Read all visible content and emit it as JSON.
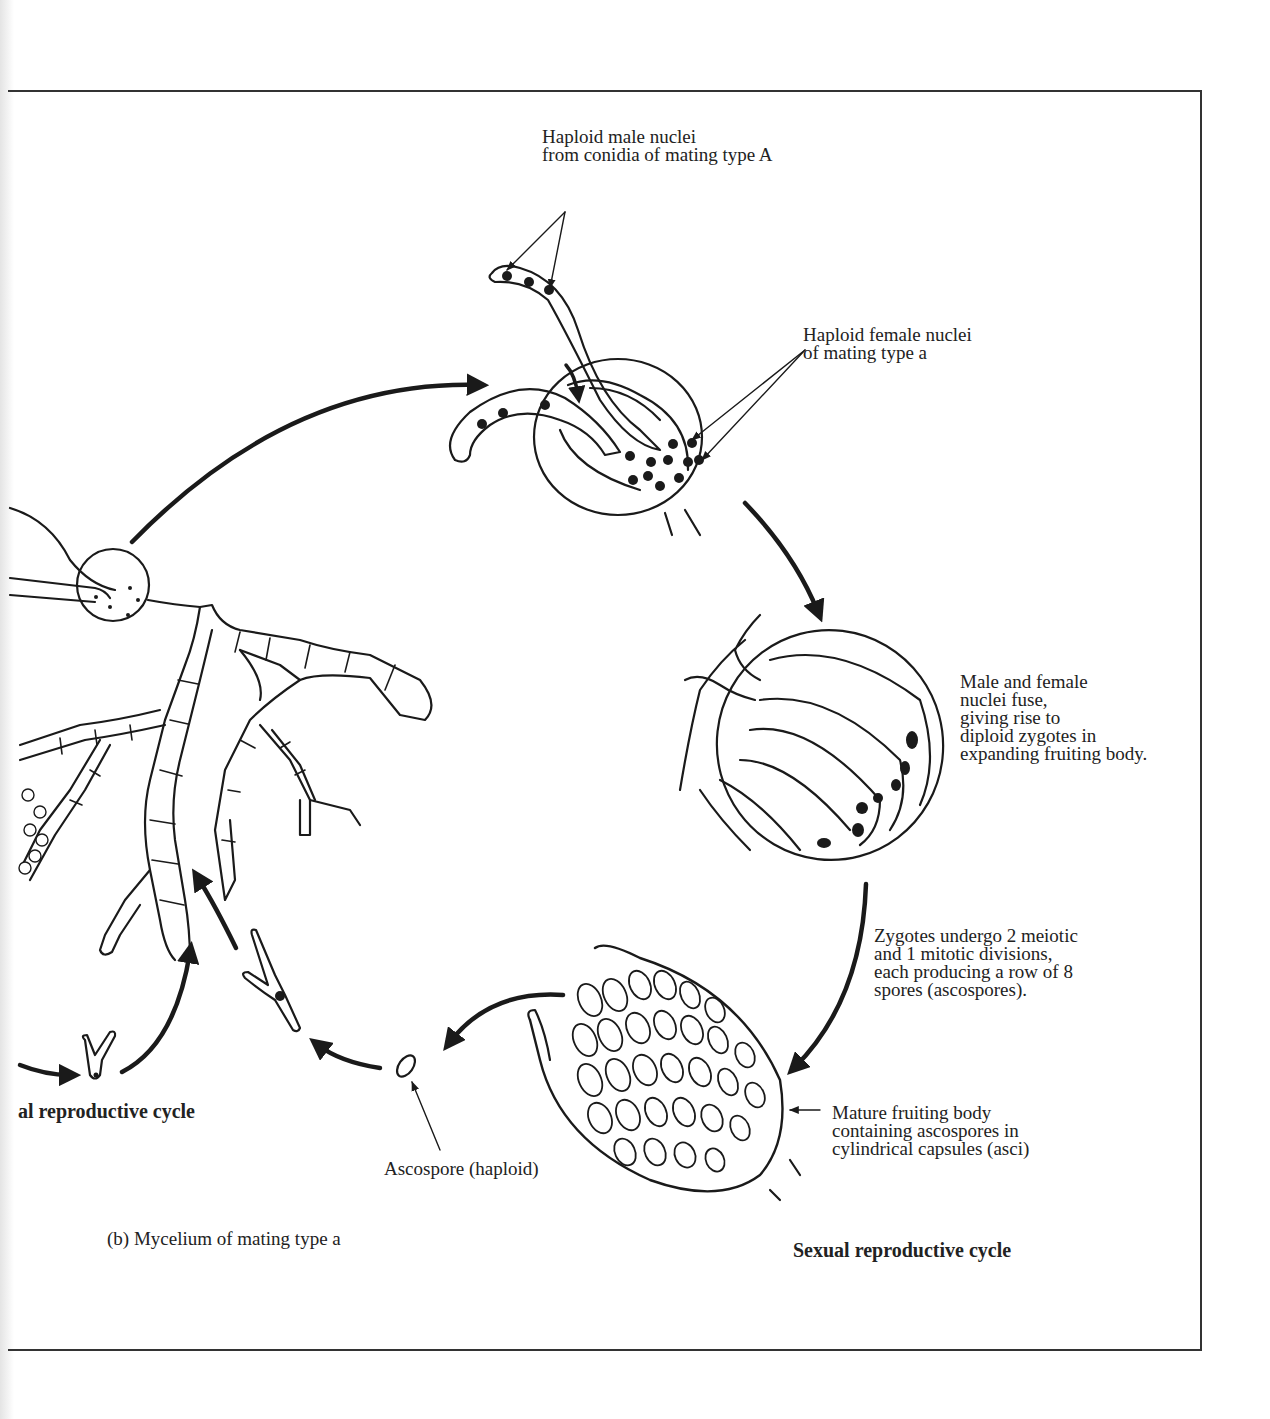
{
  "figure": {
    "panel_label": "(b) Mycelium of mating type a",
    "cycles": {
      "asexual_partial": "al reproductive cycle",
      "sexual": "Sexual reproductive cycle"
    },
    "annotations": {
      "male_nuclei": "Haploid male nuclei\nfrom conidia of mating type  A",
      "female_nuclei": "Haploid female nuclei\nof mating type  a",
      "fusion": "Male and female\nnuclei fuse,\ngiving rise to\ndiploid zygotes in\nexpanding fruiting body.",
      "meiosis": "Zygotes undergo 2 meiotic\nand 1 mitotic divisions,\neach producing a row of 8\nspores (ascospores).",
      "mature_body": "Mature fruiting body\ncontaining ascospores in\ncylindrical capsules (asci)",
      "ascospore": "Ascospore (haploid)"
    },
    "colors": {
      "ink": "#1a1a1a",
      "paper": "#ffffff",
      "frame": "#333333"
    }
  }
}
